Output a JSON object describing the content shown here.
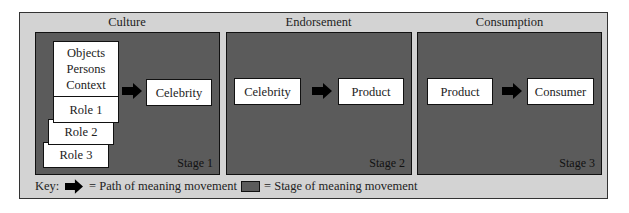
{
  "columns": [
    {
      "title": "Culture",
      "stage_label": "Stage 1"
    },
    {
      "title": "Endorsement",
      "stage_label": "Stage 2"
    },
    {
      "title": "Consumption",
      "stage_label": "Stage 3"
    }
  ],
  "stage1": {
    "source_box": [
      "Objects",
      "Persons",
      "Context"
    ],
    "roles": [
      "Role 1",
      "Role 2",
      "Role 3"
    ],
    "target": "Celebrity"
  },
  "stage2": {
    "source": "Celebrity",
    "target": "Product"
  },
  "stage3": {
    "source": "Product",
    "target": "Consumer"
  },
  "key": {
    "label": "Key:",
    "arrow_text": "= Path of meaning movement",
    "swatch_text": "= Stage of meaning movement"
  },
  "colors": {
    "background": "#d3d3d3",
    "stage": "#5b5b5b",
    "box": "#ffffff",
    "arrow": "#000000"
  }
}
